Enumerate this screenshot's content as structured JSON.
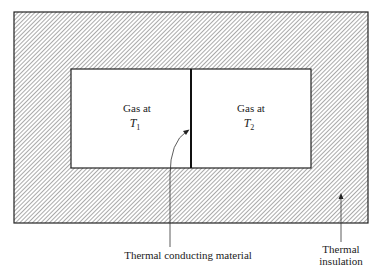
{
  "diagram": {
    "chambers": [
      {
        "label": "Gas at",
        "symbol": "T",
        "subscript": "1"
      },
      {
        "label": "Gas at",
        "symbol": "T",
        "subscript": "2"
      }
    ],
    "callouts": {
      "conductor": "Thermal conducting material",
      "insulation_line1": "Thermal",
      "insulation_line2": "insulation"
    },
    "colors": {
      "stroke": "#222222",
      "hatch": "#555555",
      "background": "#ffffff"
    }
  }
}
